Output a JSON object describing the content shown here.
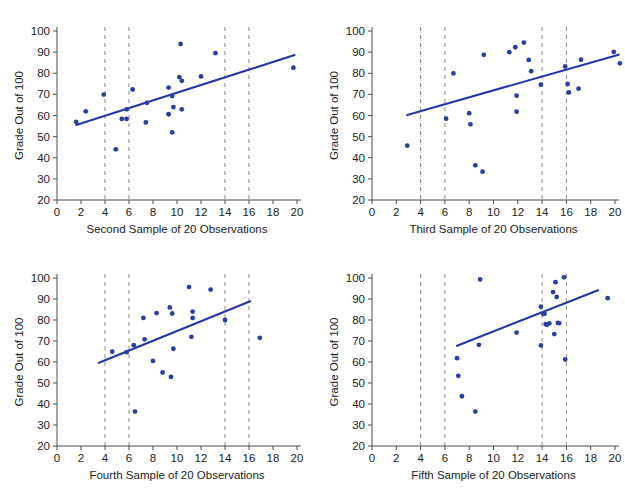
{
  "figure": {
    "title": "",
    "panel_count": 4,
    "point_color": "#2b3f9e",
    "line_color": "#2437a8",
    "cutline_color": "#8c8c8c"
  },
  "chart_data": [
    {
      "type": "scatter",
      "panel_index": 0,
      "title": "",
      "xlabel": "Second Sample of 20 Observations",
      "ylabel": "Grade Out of 100",
      "xlim": [
        0,
        20
      ],
      "ylim": [
        20,
        100
      ],
      "xticks": [
        0,
        2,
        4,
        6,
        8,
        10,
        12,
        14,
        16,
        18,
        20
      ],
      "xticklabels": [
        "0",
        "2",
        "4",
        "6",
        "8",
        "10",
        "12",
        "14",
        "16",
        "18",
        "20"
      ],
      "yticks": [
        20,
        30,
        40,
        50,
        60,
        70,
        80,
        90,
        100
      ],
      "yticklabels": [
        "20",
        "30",
        "40",
        "50",
        "60",
        "70",
        "80",
        "90",
        "100"
      ],
      "grid": false,
      "legend": "none",
      "vertical_reference_lines": [
        4,
        6,
        14,
        16
      ],
      "points": [
        [
          1.6,
          57.0
        ],
        [
          2.4,
          62.0
        ],
        [
          3.9,
          69.9
        ],
        [
          4.9,
          44.0
        ],
        [
          5.4,
          58.4
        ],
        [
          5.8,
          62.9
        ],
        [
          5.8,
          58.4
        ],
        [
          6.3,
          72.3
        ],
        [
          7.4,
          56.7
        ],
        [
          7.5,
          66.0
        ],
        [
          9.3,
          60.6
        ],
        [
          9.3,
          73.2
        ],
        [
          9.6,
          69.2
        ],
        [
          9.7,
          64.0
        ],
        [
          9.6,
          52.0
        ],
        [
          10.2,
          78.2
        ],
        [
          10.3,
          93.9
        ],
        [
          10.4,
          76.4
        ],
        [
          10.4,
          62.9
        ],
        [
          12.0,
          78.5
        ],
        [
          13.2,
          89.5
        ],
        [
          19.7,
          82.6
        ]
      ],
      "fit_line": {
        "x0": 1.6,
        "y0": 55.5,
        "x1": 19.8,
        "y1": 88.6
      }
    },
    {
      "type": "scatter",
      "panel_index": 1,
      "title": "",
      "xlabel": "Third Sample of 20 Observations",
      "ylabel": "Grade Out of 100",
      "xlim": [
        0,
        20
      ],
      "ylim": [
        20,
        100
      ],
      "xticks": [
        0,
        2,
        4,
        6,
        8,
        10,
        12,
        14,
        16,
        18,
        20
      ],
      "xticklabels": [
        "0",
        "2",
        "4",
        "6",
        "8",
        "10",
        "12",
        "14",
        "16",
        "18",
        "20"
      ],
      "yticks": [
        20,
        30,
        40,
        50,
        60,
        70,
        80,
        90,
        100
      ],
      "yticklabels": [
        "20",
        "30",
        "40",
        "50",
        "60",
        "70",
        "80",
        "90",
        "100"
      ],
      "grid": false,
      "legend": "none",
      "vertical_reference_lines": [
        4,
        6,
        14,
        16
      ],
      "points": [
        [
          2.9,
          45.7
        ],
        [
          6.1,
          58.5
        ],
        [
          6.7,
          79.9
        ],
        [
          8.0,
          61.1
        ],
        [
          8.1,
          55.8
        ],
        [
          8.5,
          36.4
        ],
        [
          9.1,
          33.4
        ],
        [
          9.2,
          88.7
        ],
        [
          11.3,
          90.0
        ],
        [
          11.8,
          92.3
        ],
        [
          11.9,
          69.4
        ],
        [
          11.9,
          61.8
        ],
        [
          12.5,
          94.5
        ],
        [
          12.9,
          86.3
        ],
        [
          13.1,
          81.0
        ],
        [
          13.9,
          74.6
        ],
        [
          15.9,
          83.2
        ],
        [
          16.1,
          74.9
        ],
        [
          16.2,
          70.9
        ],
        [
          17.0,
          72.7
        ],
        [
          17.2,
          86.4
        ],
        [
          19.9,
          90.1
        ],
        [
          20.4,
          84.7
        ]
      ],
      "fit_line": {
        "x0": 2.9,
        "y0": 60.2,
        "x1": 20.3,
        "y1": 88.8
      }
    },
    {
      "type": "scatter",
      "panel_index": 2,
      "title": "",
      "xlabel": "Fourth Sample of 20 Observations",
      "ylabel": "Grade Out of 100",
      "xlim": [
        0,
        20
      ],
      "ylim": [
        20,
        100
      ],
      "xticks": [
        0,
        2,
        4,
        6,
        8,
        10,
        12,
        14,
        16,
        18,
        20
      ],
      "xticklabels": [
        "0",
        "2",
        "4",
        "6",
        "8",
        "10",
        "12",
        "14",
        "16",
        "18",
        "20"
      ],
      "yticks": [
        20,
        30,
        40,
        50,
        60,
        70,
        80,
        90,
        100
      ],
      "yticklabels": [
        "20",
        "30",
        "40",
        "50",
        "60",
        "70",
        "80",
        "90",
        "100"
      ],
      "grid": false,
      "legend": "none",
      "vertical_reference_lines": [
        4,
        6,
        14,
        16
      ],
      "points": [
        [
          4.6,
          64.9
        ],
        [
          5.8,
          64.7
        ],
        [
          6.4,
          68.0
        ],
        [
          6.5,
          36.4
        ],
        [
          7.2,
          81.0
        ],
        [
          7.3,
          70.8
        ],
        [
          8.0,
          60.5
        ],
        [
          8.3,
          83.3
        ],
        [
          8.8,
          55.0
        ],
        [
          9.4,
          86.0
        ],
        [
          9.5,
          52.9
        ],
        [
          9.6,
          83.1
        ],
        [
          9.7,
          66.3
        ],
        [
          11.0,
          95.7
        ],
        [
          11.2,
          72.0
        ],
        [
          11.3,
          84.0
        ],
        [
          11.3,
          81.0
        ],
        [
          12.8,
          94.5
        ],
        [
          14.0,
          80.0
        ],
        [
          16.9,
          71.5
        ]
      ],
      "fit_line": {
        "x0": 3.5,
        "y0": 59.6,
        "x1": 16.1,
        "y1": 88.9
      }
    },
    {
      "type": "scatter",
      "panel_index": 3,
      "title": "",
      "xlabel": "Fifth Sample of 20 Observations",
      "ylabel": "Grade Out of 100",
      "xlim": [
        0,
        20
      ],
      "ylim": [
        20,
        100
      ],
      "xticks": [
        0,
        2,
        4,
        6,
        8,
        10,
        12,
        14,
        16,
        18,
        20
      ],
      "xticklabels": [
        "0",
        "2",
        "4",
        "6",
        "8",
        "10",
        "12",
        "14",
        "16",
        "18",
        "20"
      ],
      "yticks": [
        20,
        30,
        40,
        50,
        60,
        70,
        80,
        90,
        100
      ],
      "yticklabels": [
        "20",
        "30",
        "40",
        "50",
        "60",
        "70",
        "80",
        "90",
        "100"
      ],
      "grid": false,
      "legend": "none",
      "vertical_reference_lines": [
        4,
        6,
        14,
        16
      ],
      "points": [
        [
          7.0,
          61.8
        ],
        [
          7.1,
          53.4
        ],
        [
          7.4,
          43.7
        ],
        [
          8.5,
          36.4
        ],
        [
          8.8,
          68.2
        ],
        [
          8.9,
          99.3
        ],
        [
          11.9,
          74.0
        ],
        [
          13.9,
          86.3
        ],
        [
          13.9,
          67.9
        ],
        [
          14.1,
          82.9
        ],
        [
          14.2,
          83.0
        ],
        [
          14.3,
          78.0
        ],
        [
          14.4,
          77.7
        ],
        [
          14.6,
          78.4
        ],
        [
          14.9,
          93.3
        ],
        [
          15.0,
          73.3
        ],
        [
          15.1,
          98.0
        ],
        [
          15.2,
          91.0
        ],
        [
          15.3,
          78.6
        ],
        [
          15.4,
          78.5
        ],
        [
          15.8,
          100.3
        ],
        [
          15.9,
          61.2
        ],
        [
          19.4,
          90.4
        ]
      ],
      "fit_line": {
        "x0": 7.0,
        "y0": 67.7,
        "x1": 18.6,
        "y1": 94.2
      }
    }
  ]
}
